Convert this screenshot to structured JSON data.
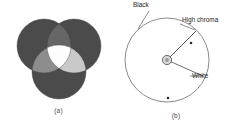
{
  "figure": {
    "type": "two-panel-diagram",
    "background_color": "#ffffff",
    "width": 235,
    "height": 131
  },
  "panel_a": {
    "caption": "(a)",
    "description": "additive-color-mixing-venn",
    "circle_count": 3,
    "circles": [
      {
        "name": "left-circle",
        "cx": 44,
        "cy": 46,
        "r": 27,
        "fill": "#4b4b4b"
      },
      {
        "name": "right-circle",
        "cx": 74,
        "cy": 46,
        "r": 27,
        "fill": "#4b4b4b"
      },
      {
        "name": "bottom-circle",
        "cx": 59,
        "cy": 72,
        "r": 27,
        "fill": "#4b4b4b"
      }
    ],
    "overlaps": [
      {
        "name": "left-right-overlap",
        "fill": "#6f6f6f"
      },
      {
        "name": "left-bottom-overlap",
        "fill": "#8a8a8a"
      },
      {
        "name": "right-bottom-overlap",
        "fill": "#c9c9c9"
      },
      {
        "name": "center-triple-overlap",
        "fill": "#fdfdfd"
      }
    ],
    "colors": {
      "primary_disc": "#4b4b4b",
      "pair_overlap_dark": "#6f6f6f",
      "pair_overlap_mid": "#8a8a8a",
      "pair_overlap_light": "#c9c9c9",
      "center": "#fdfdfd"
    }
  },
  "panel_b": {
    "caption": "(b)",
    "description": "chroma-lightness-circle",
    "main_circle": {
      "name": "chroma-circle",
      "cx": 50,
      "cy": 60,
      "r": 42,
      "stroke": "#5a5a5a"
    },
    "center_marker": {
      "name": "center-gray-point",
      "cx": 50,
      "cy": 60,
      "r": 4.5,
      "label": "a"
    },
    "radial_lines": [
      {
        "name": "high-chroma-radius",
        "to_x": 79,
        "to_y": 31
      },
      {
        "name": "white-radius",
        "to_x": 86,
        "to_y": 76
      }
    ],
    "dot_markers": [
      {
        "name": "chroma-dot-upper-right",
        "cx": 74,
        "cy": 43
      },
      {
        "name": "chroma-dot-bottom",
        "cx": 51,
        "cy": 98
      }
    ],
    "annotations": [
      {
        "name": "black-label",
        "text": "Black",
        "leader_from_x": 32,
        "leader_from_y": 11,
        "leader_to_x": 21,
        "leader_to_y": 29
      },
      {
        "name": "high-chroma-label",
        "text": "High chroma",
        "leader_from_x": 64,
        "leader_from_y": 25,
        "leader_to_x": 79,
        "leader_to_y": 31
      },
      {
        "name": "white-label",
        "text": "White",
        "leader_from_x": 86,
        "leader_from_y": 76,
        "leader_to_x": 74,
        "leader_to_y": 76
      }
    ],
    "colors": {
      "stroke": "#5a5a5a",
      "leader": "#3a3a3a",
      "text": "#222222",
      "center_fill": "#b9b9b9"
    }
  }
}
